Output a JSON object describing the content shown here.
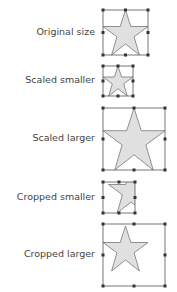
{
  "rows": [
    {
      "label": "Original size"
    },
    {
      "label": "Scaled smaller"
    },
    {
      "label": "Scaled larger"
    },
    {
      "label": "Cropped smaller"
    },
    {
      "label": "Cropped larger"
    }
  ],
  "colors": {
    "star_fill": "#e0e0e0",
    "star_stroke": "#777777",
    "frame": "#555555",
    "handle": "#333333",
    "text": "#444444"
  }
}
